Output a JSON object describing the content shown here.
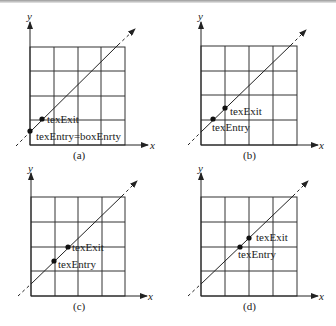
{
  "figure": {
    "panels": [
      {
        "id": "a",
        "caption": "(a)",
        "x_axis_label": "x",
        "y_axis_label": "y",
        "grid": "4x4",
        "points": [
          {
            "name": "texExit",
            "label": "texExit"
          },
          {
            "name": "texEntry",
            "label": "texEntry=boxEnrty"
          }
        ]
      },
      {
        "id": "b",
        "caption": "(b)",
        "x_axis_label": "x",
        "y_axis_label": "y",
        "grid": "4x4",
        "points": [
          {
            "name": "texExit",
            "label": "texExit"
          },
          {
            "name": "texEntry",
            "label": "texEntry"
          }
        ]
      },
      {
        "id": "c",
        "caption": "(c)",
        "x_axis_label": "x",
        "y_axis_label": "y",
        "grid": "4x4",
        "points": [
          {
            "name": "texExit",
            "label": "texExit"
          },
          {
            "name": "texEntry",
            "label": "texEntry"
          }
        ]
      },
      {
        "id": "d",
        "caption": "(d)",
        "x_axis_label": "x",
        "y_axis_label": "y",
        "grid": "4x4",
        "points": [
          {
            "name": "texExit",
            "label": "texExit"
          },
          {
            "name": "texEntry",
            "label": "texEntry"
          }
        ]
      }
    ],
    "colors": {
      "line": "#222222",
      "grid": "#333333",
      "background": "#ffffff"
    }
  }
}
